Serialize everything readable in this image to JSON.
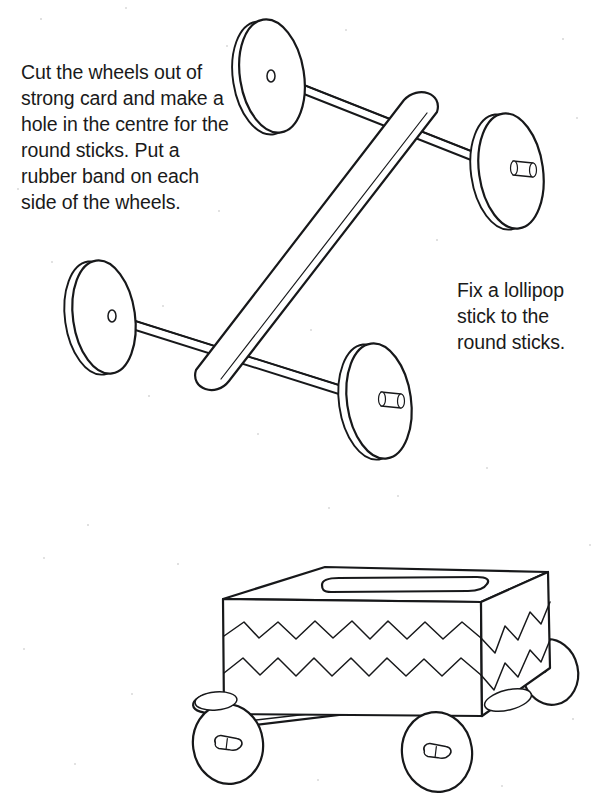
{
  "page": {
    "width": 596,
    "height": 796,
    "background_color": "#ffffff",
    "ink_color": "#1a1a1a"
  },
  "instructions": [
    {
      "id": "wheels",
      "text": "Cut the wheels out of strong card and make a hole in the centre for the round sticks. Put a rubber band on each side of the wheels."
    },
    {
      "id": "lollipop",
      "text": "Fix a lollipop stick to the round sticks."
    }
  ],
  "figures": [
    {
      "id": "axle-assembly",
      "name": "wheel-axle-assembly-diagram",
      "caption_refs": [
        "wheels",
        "lollipop"
      ],
      "parts": [
        "card-wheel-top-left",
        "card-wheel-top-right",
        "card-wheel-bottom-left",
        "card-wheel-bottom-right",
        "round-stick-axle-upper",
        "round-stick-axle-lower",
        "lollipop-stick"
      ]
    },
    {
      "id": "tissue-box-car",
      "name": "finished-tissue-box-car-diagram",
      "parts": [
        "tissue-box-body",
        "tissue-slot",
        "zigzag-decoration-upper",
        "zigzag-decoration-lower",
        "front-near-wheel",
        "rear-near-wheel",
        "front-far-wheel",
        "rear-far-wheel"
      ]
    }
  ]
}
